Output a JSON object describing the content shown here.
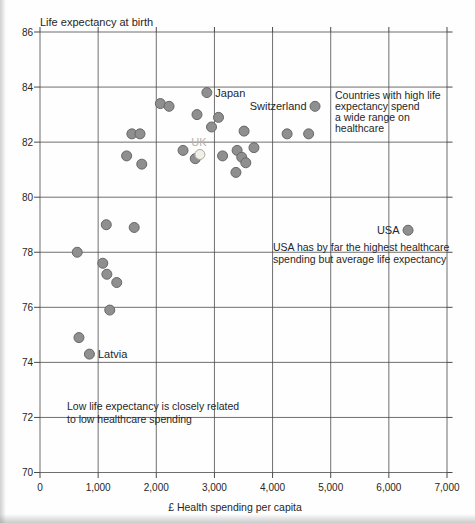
{
  "figure": {
    "title": "Life expectancy at birth",
    "x_axis_label": "£ Health spending per capita"
  },
  "chart_data": {
    "type": "scatter",
    "title": "Life expectancy at birth",
    "xlabel": "£ Health spending per capita",
    "ylabel": "Life expectancy at birth",
    "xlim": [
      0,
      7000
    ],
    "ylim": [
      70,
      86
    ],
    "grid": true,
    "x_ticks": [
      0,
      1000,
      2000,
      3000,
      4000,
      5000,
      6000,
      7000
    ],
    "x_tick_labels": [
      "0",
      "1,000",
      "2,000",
      "3,000",
      "4,000",
      "5,000",
      "6,000",
      "7,000"
    ],
    "y_ticks": [
      70,
      72,
      74,
      76,
      78,
      80,
      82,
      84,
      86
    ],
    "y_tick_labels": [
      "70",
      "72",
      "74",
      "76",
      "78",
      "80",
      "82",
      "84",
      "86"
    ],
    "colors": {
      "point_fill": "#8f8f8f",
      "point_stroke": "#676767",
      "highlight_fill": "#f0efe8",
      "highlight_stroke": "#a9a9a1",
      "grid_line": "#4a4a4a",
      "text": "#262626",
      "muted_label": "#b2b2ac"
    },
    "points": [
      {
        "x": 2870,
        "y": 83.8,
        "label": "Japan",
        "label_side": "right"
      },
      {
        "x": 2070,
        "y": 83.4
      },
      {
        "x": 2220,
        "y": 83.3
      },
      {
        "x": 4730,
        "y": 83.3,
        "label": "Switzerland",
        "label_side": "left"
      },
      {
        "x": 2700,
        "y": 83.0
      },
      {
        "x": 3070,
        "y": 82.9
      },
      {
        "x": 2950,
        "y": 82.55
      },
      {
        "x": 3510,
        "y": 82.4
      },
      {
        "x": 4250,
        "y": 82.3
      },
      {
        "x": 4620,
        "y": 82.3
      },
      {
        "x": 1580,
        "y": 82.3
      },
      {
        "x": 1720,
        "y": 82.3
      },
      {
        "x": 1490,
        "y": 81.5
      },
      {
        "x": 1750,
        "y": 81.2
      },
      {
        "x": 2460,
        "y": 81.7
      },
      {
        "x": 2670,
        "y": 81.4
      },
      {
        "x": 2750,
        "y": 81.55,
        "label": "UK",
        "label_side": "above",
        "highlight": true
      },
      {
        "x": 3140,
        "y": 81.5
      },
      {
        "x": 3680,
        "y": 81.8
      },
      {
        "x": 3390,
        "y": 81.7
      },
      {
        "x": 3470,
        "y": 81.45
      },
      {
        "x": 3540,
        "y": 81.25
      },
      {
        "x": 3370,
        "y": 80.9
      },
      {
        "x": 1140,
        "y": 79.0
      },
      {
        "x": 1620,
        "y": 78.9
      },
      {
        "x": 640,
        "y": 78.0
      },
      {
        "x": 1080,
        "y": 77.6
      },
      {
        "x": 1150,
        "y": 77.2
      },
      {
        "x": 1320,
        "y": 76.9
      },
      {
        "x": 1200,
        "y": 75.9
      },
      {
        "x": 670,
        "y": 74.9
      },
      {
        "x": 850,
        "y": 74.3,
        "label": "Latvia",
        "label_side": "right"
      },
      {
        "x": 6330,
        "y": 78.8,
        "label": "USA",
        "label_side": "left"
      }
    ],
    "annotations": [
      {
        "name": "high-spend-note",
        "x": 335,
        "y": 99,
        "line_height": 11,
        "lines": [
          "Countries with high life",
          "expectancy spend",
          "a wide range on",
          "healthcare"
        ]
      },
      {
        "name": "usa-note",
        "x": 273,
        "y": 250.5,
        "line_height": 12,
        "lines": [
          "USA has by far the highest healthcare",
          "spending but average life expectancy"
        ]
      },
      {
        "name": "low-spend-note",
        "x": 67,
        "y": 410,
        "line_height": 12.5,
        "lines": [
          "Low life expectancy is closely related",
          "to low healthcare spending"
        ]
      }
    ]
  }
}
